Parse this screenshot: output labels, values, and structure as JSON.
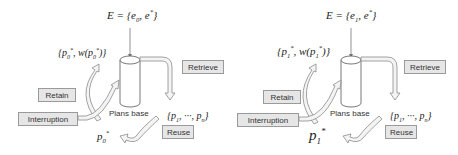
{
  "panels": [
    {
      "id": "left",
      "E_label": "E = {e",
      "E_sub": "0",
      "E_rest": ", e",
      "E_star": "*",
      "E_close": "}",
      "retained": "{p",
      "retained_sub": "0",
      "retained_star": "*",
      "retained_mid": ", w(p",
      "retained_sub2": "0",
      "retained_star2": "*",
      "retained_close": ")}",
      "candidates": "{p",
      "candidates_sub1": "1",
      "candidates_mid": ", ···, p",
      "candidates_subn": "n",
      "candidates_close": "}",
      "selected": "p",
      "selected_sub": "0",
      "selected_star": "*",
      "plans_base": "Plans base",
      "retrieve": "Retrieve",
      "retain": "Retain",
      "interruption": "Interruption",
      "reuse": "Reuse"
    },
    {
      "id": "right",
      "E_label": "E = {e",
      "E_sub": "1",
      "E_rest": ", e",
      "E_star": "*",
      "E_close": "}",
      "retained": "{p",
      "retained_sub": "1",
      "retained_star": "*",
      "retained_mid": ", w(p",
      "retained_sub2": "1",
      "retained_star2": "*",
      "retained_close": ")}",
      "candidates": "{p",
      "candidates_sub1": "1",
      "candidates_mid": ", ···, p",
      "candidates_subn": "n",
      "candidates_close": "}",
      "selected": "p",
      "selected_sub": "1",
      "selected_star": "*",
      "plans_base": "Plans base",
      "retrieve": "Retrieve",
      "retain": "Retain",
      "interruption": "Interruption",
      "reuse": "Reuse"
    }
  ],
  "colors": {
    "box_fill": "#e6e6e6",
    "box_border": "#9a9a9a",
    "arrow_fill": "#f4f4f4",
    "arrow_stroke": "#8c8c8c"
  }
}
